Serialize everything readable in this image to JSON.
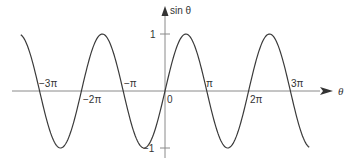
{
  "chart_data": {
    "type": "line",
    "title": "",
    "xlabel": "θ",
    "ylabel": "sin θ",
    "function": "sin(θ)",
    "xlim": [
      -3.45,
      3.45
    ],
    "xlim_units": "π",
    "ylim": [
      -1,
      1
    ],
    "grid": false,
    "legend": null,
    "x_ticks": [
      {
        "value": -3,
        "label": "−3π"
      },
      {
        "value": -2,
        "label": "−2π"
      },
      {
        "value": -1,
        "label": "−π"
      },
      {
        "value": 0,
        "label": "0"
      },
      {
        "value": 1,
        "label": "π"
      },
      {
        "value": 2,
        "label": "2π"
      },
      {
        "value": 3,
        "label": "3π"
      }
    ],
    "y_ticks": [
      {
        "value": 1,
        "label": "1"
      },
      {
        "value": -1,
        "label": "−1"
      }
    ],
    "series": [
      {
        "name": "sin θ",
        "x_in_pi": [
          -3.45,
          -3.0,
          -2.5,
          -2.0,
          -1.5,
          -1.0,
          -0.5,
          0.0,
          0.5,
          1.0,
          1.5,
          2.0,
          2.5,
          3.0,
          3.45
        ],
        "values": [
          0.99,
          0,
          -1,
          0,
          1,
          0,
          -1,
          0,
          1,
          0,
          -1,
          0,
          1,
          0,
          -0.99
        ]
      }
    ]
  },
  "labels": {
    "y_axis": "sin θ",
    "x_axis": "θ",
    "origin": "0",
    "y_one": "1",
    "y_minus_one": "−1",
    "x_neg3pi": "−3π",
    "x_neg2pi": "−2π",
    "x_negpi": "−π",
    "x_pi": "π",
    "x_2pi": "2π",
    "x_3pi": "3π"
  },
  "colors": {
    "curve": "#3a3a3a",
    "axis": "#8a8a8a",
    "text": "#333333"
  }
}
